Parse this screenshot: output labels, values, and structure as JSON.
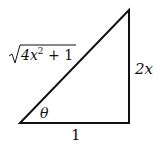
{
  "diagram": {
    "type": "right-triangle",
    "labels": {
      "hypotenuse_radicand": "4x",
      "hypotenuse_exp": "2",
      "hypotenuse_tail": " + 1",
      "opposite": "2x",
      "adjacent": "1",
      "angle": "θ"
    },
    "vertices": {
      "angle_vertex": [
        20,
        123
      ],
      "right_angle_vertex": [
        129,
        123
      ],
      "top_vertex": [
        129,
        10
      ]
    },
    "colors": {
      "stroke": "#111111",
      "background": "#ffffff"
    }
  }
}
